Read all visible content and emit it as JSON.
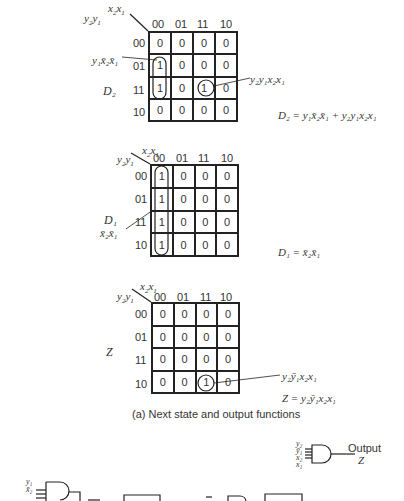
{
  "map_axes": {
    "col_var": "x2x1",
    "row_var": "y2y1",
    "col_headers": [
      "00",
      "01",
      "11",
      "10"
    ],
    "row_headers": [
      "00",
      "01",
      "11",
      "10"
    ]
  },
  "maps": [
    {
      "name": "D2",
      "label": "D₂",
      "cells": [
        [
          "0",
          "0",
          "0",
          "0"
        ],
        [
          "1",
          "0",
          "0",
          "0"
        ],
        [
          "1",
          "0",
          "1",
          "0"
        ],
        [
          "0",
          "0",
          "0",
          "0"
        ]
      ],
      "annotations": [
        "y₁x̄₂x̄₁",
        "y₂y₁x₂x₁"
      ],
      "equation": "D₂ = y₁x̄₂x̄₁ + y₂y₁x₂x₁"
    },
    {
      "name": "D1",
      "label": "D₁",
      "cells": [
        [
          "1",
          "0",
          "0",
          "0"
        ],
        [
          "1",
          "0",
          "0",
          "0"
        ],
        [
          "1",
          "0",
          "0",
          "0"
        ],
        [
          "1",
          "0",
          "0",
          "0"
        ]
      ],
      "annotations": [
        "x̄₂x̄₁"
      ],
      "equation": "D₁ = x̄₂x̄₁"
    },
    {
      "name": "Z",
      "label": "Z",
      "cells": [
        [
          "0",
          "0",
          "0",
          "0"
        ],
        [
          "0",
          "0",
          "0",
          "0"
        ],
        [
          "0",
          "0",
          "0",
          "0"
        ],
        [
          "0",
          "0",
          "1",
          "0"
        ]
      ],
      "annotations": [
        "y₂ȳ₁x₂x₁"
      ],
      "equation": "Z = y₂ȳ₁x₂x₁"
    }
  ],
  "caption": "(a)  Next state and output functions",
  "circuit": {
    "output_gate_inputs": [
      "y₂",
      "ȳ₁",
      "x₂",
      "x₁"
    ],
    "output_label": "Output",
    "output_var": "Z",
    "d2_gate_inputs": [
      "y₁",
      "x̄₂"
    ]
  }
}
